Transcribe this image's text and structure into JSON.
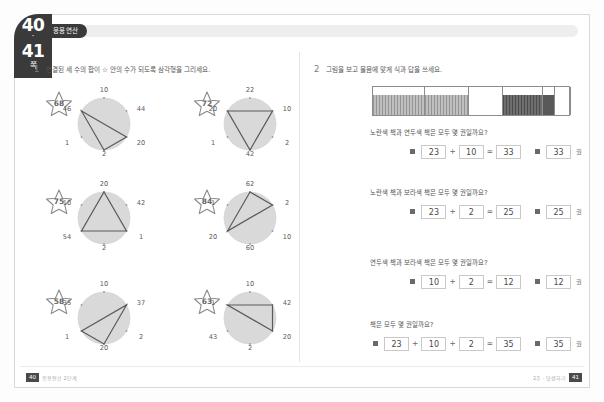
{
  "page_tab": {
    "page_left": "40",
    "dot": "·",
    "page_right": "41",
    "label": "쪽"
  },
  "unit_badge": "응용연산",
  "problems": [
    {
      "number": "1",
      "instruction": "연결된 세 수의 합이 ☆ 안의 수가 되도록 삼각형을 그리세요."
    },
    {
      "number": "2",
      "instruction": "그림을 보고 물음에 맞게 식과 답을 쓰세요."
    }
  ],
  "circles": [
    {
      "star": "68",
      "numbers": [
        "10",
        "44",
        "20",
        "2",
        "1",
        "46"
      ],
      "triangle_vertices": [
        5,
        2,
        3
      ]
    },
    {
      "star": "72",
      "numbers": [
        "22",
        "10",
        "2",
        "42",
        "1",
        "20"
      ],
      "triangle_vertices": [
        5,
        1,
        3
      ]
    },
    {
      "star": "75",
      "numbers": [
        "20",
        "42",
        "1",
        "2",
        "54",
        "10"
      ],
      "triangle_vertices": [
        0,
        2,
        4
      ]
    },
    {
      "star": "84",
      "numbers": [
        "62",
        "2",
        "10",
        "60",
        "20",
        "1"
      ],
      "triangle_vertices": [
        0,
        1,
        4
      ]
    },
    {
      "star": "58",
      "numbers": [
        "10",
        "37",
        "2",
        "20",
        "1",
        "35"
      ],
      "triangle_vertices": [
        1,
        3,
        4
      ]
    },
    {
      "star": "63",
      "numbers": [
        "10",
        "42",
        "20",
        "2",
        "43",
        "1"
      ],
      "triangle_vertices": [
        1,
        2,
        5
      ]
    }
  ],
  "bar_chart": {
    "segments": [
      {
        "fill": "hatch-grey",
        "width": 52,
        "label": "yellow-books-a"
      },
      {
        "fill": "hatch-grey",
        "width": 44,
        "label": "yellow-books-b"
      },
      {
        "fill": "none",
        "width": 34,
        "label": "empty-a"
      },
      {
        "fill": "hatch-dark",
        "width": 40,
        "label": "green-books"
      },
      {
        "fill": "solid-dark",
        "width": 12,
        "label": "purple-books"
      },
      {
        "fill": "none",
        "width": 16,
        "label": "empty-b"
      }
    ]
  },
  "questions": [
    {
      "text": "노란색 책과 연두색 책은 모두 몇 권일까요?",
      "equation": [
        "23",
        "+",
        "10",
        "=",
        "33"
      ],
      "answer": "33",
      "unit": "권"
    },
    {
      "text": "노란색 책과 보라색 책은 모두 몇 권일까요?",
      "equation": [
        "23",
        "+",
        "2",
        "=",
        "25"
      ],
      "answer": "25",
      "unit": "권"
    },
    {
      "text": "연두색 책과 보라색 책은 모두 몇 권일까요?",
      "equation": [
        "10",
        "+",
        "2",
        "=",
        "12"
      ],
      "answer": "12",
      "unit": "권"
    },
    {
      "text": "책은 모두 몇 권일까요?",
      "equation": [
        "23",
        "+",
        "10",
        "+",
        "2",
        "=",
        "35"
      ],
      "answer": "35",
      "unit": "권"
    }
  ],
  "footer": {
    "left_page": "40",
    "left_text": "응용연산 2단계",
    "right_text": "2주 · 덧셈하기",
    "right_page": "41"
  },
  "colors": {
    "tab_dark": "#3a3a3a",
    "circle_fill": "#d9d9d9",
    "line": "#555555"
  }
}
